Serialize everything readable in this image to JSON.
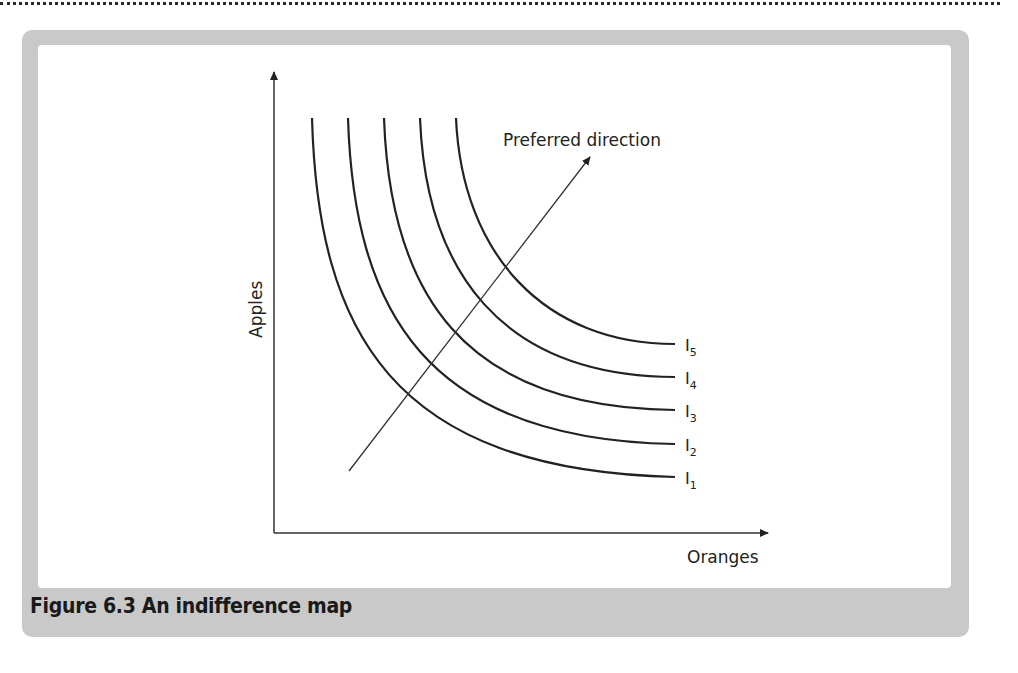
{
  "figure": {
    "caption": "Figure 6.3  An indifference map",
    "y_axis_label": "Apples",
    "x_axis_label": "Oranges",
    "arrow_label": "Preferred direction",
    "curves": [
      {
        "id": "I1",
        "base": "I",
        "sub": "1"
      },
      {
        "id": "I2",
        "base": "I",
        "sub": "2"
      },
      {
        "id": "I3",
        "base": "I",
        "sub": "3"
      },
      {
        "id": "I4",
        "base": "I",
        "sub": "4"
      },
      {
        "id": "I5",
        "base": "I",
        "sub": "5"
      }
    ],
    "colors": {
      "frame": "#c9c9c9",
      "canvas": "#ffffff",
      "ink": "#222222"
    }
  }
}
